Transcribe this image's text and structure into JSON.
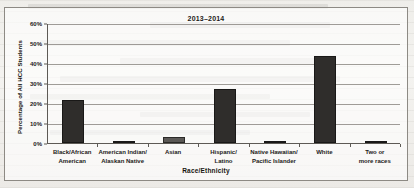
{
  "chart_data": {
    "type": "bar",
    "title": "2013–2014",
    "xlabel": "Race/Ethnicity",
    "ylabel": "Percentage of All HCC Students",
    "categories": [
      "Black/African\nAmerican",
      "American Indian/\nAlaskan Native",
      "Asian",
      "Hispanic/\nLatino",
      "Native Hawaiian/\nPacific Islander",
      "White",
      "Two or\nmore races"
    ],
    "values": [
      21.5,
      0.6,
      3.0,
      27.0,
      0.3,
      43.5,
      0.9
    ],
    "ylim": [
      0,
      60
    ],
    "yticks": [
      0,
      10,
      20,
      30,
      40,
      50,
      60
    ],
    "ytick_labels": [
      "0%",
      "10%",
      "20%",
      "30%",
      "40%",
      "50%",
      "60%"
    ],
    "grid": true,
    "legend": "none",
    "bar_color": "#2f2d2b",
    "axis_color": "#5d5a55",
    "grid_color": "#8e8b86"
  }
}
